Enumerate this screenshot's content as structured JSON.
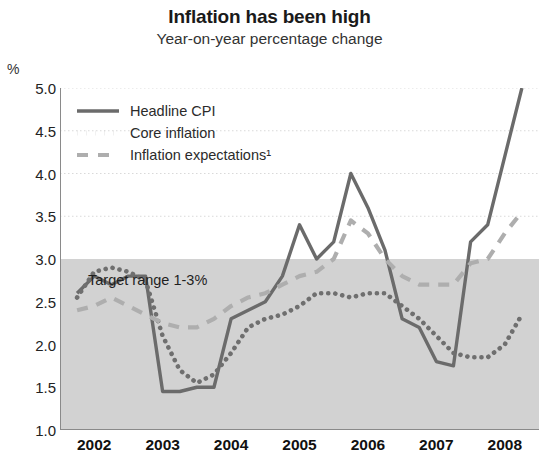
{
  "header": {
    "title": "Inflation has been high",
    "subtitle": "Year-on-year percentage change",
    "unit_label": "%"
  },
  "annotations": {
    "target_band_label": "Target range 1-3%"
  },
  "colors": {
    "headline": "#6b6b6b",
    "core": "#6f6f6f",
    "expectations": "#aeaeae",
    "band_fill": "#d2d2d2",
    "gridline": "#d9d9d9",
    "axis": "#8a8a8a",
    "text": "#1a1a1a",
    "background": "#ffffff"
  },
  "chart_data": {
    "type": "line",
    "title": "Inflation has been high",
    "subtitle": "Year-on-year percentage change",
    "xlabel": "",
    "ylabel": "%",
    "ylim": [
      1.0,
      5.0
    ],
    "xlim": [
      2001.5,
      2008.5
    ],
    "ytick_labels": [
      "1.0",
      "1.5",
      "2.0",
      "2.5",
      "3.0",
      "3.5",
      "4.0",
      "4.5",
      "5.0"
    ],
    "ytick_values": [
      1.0,
      1.5,
      2.0,
      2.5,
      3.0,
      3.5,
      4.0,
      4.5,
      5.0
    ],
    "xtick_labels": [
      "2002",
      "2003",
      "2004",
      "2005",
      "2006",
      "2007",
      "2008"
    ],
    "xtick_values": [
      2002,
      2003,
      2004,
      2005,
      2006,
      2007,
      2008
    ],
    "grid": true,
    "legend_position": "top-left",
    "shaded_band": {
      "label": "Target range 1-3%",
      "y_from": 1.0,
      "y_to": 3.0,
      "color": "#d2d2d2"
    },
    "series": [
      {
        "name": "Headline CPI",
        "style": "solid",
        "color": "#6b6b6b",
        "x": [
          2001.75,
          2002.0,
          2002.25,
          2002.5,
          2002.75,
          2003.0,
          2003.25,
          2003.5,
          2003.75,
          2004.0,
          2004.25,
          2004.5,
          2004.75,
          2005.0,
          2005.25,
          2005.5,
          2005.75,
          2006.0,
          2006.25,
          2006.5,
          2006.75,
          2007.0,
          2007.25,
          2007.5,
          2007.75,
          2008.0,
          2008.25
        ],
        "values": [
          2.6,
          2.8,
          2.7,
          2.8,
          2.8,
          1.45,
          1.45,
          1.5,
          1.5,
          2.3,
          2.4,
          2.5,
          2.8,
          3.4,
          3.0,
          3.2,
          4.0,
          3.6,
          3.1,
          2.3,
          2.2,
          1.8,
          1.75,
          3.2,
          3.4,
          4.2,
          5.0
        ]
      },
      {
        "name": "Core inflation",
        "style": "dotted",
        "color": "#6f6f6f",
        "x": [
          2001.75,
          2002.0,
          2002.25,
          2002.5,
          2002.75,
          2003.0,
          2003.25,
          2003.5,
          2003.75,
          2004.0,
          2004.25,
          2004.5,
          2004.75,
          2005.0,
          2005.25,
          2005.5,
          2005.75,
          2006.0,
          2006.25,
          2006.5,
          2006.75,
          2007.0,
          2007.25,
          2007.5,
          2007.75,
          2008.0,
          2008.25
        ],
        "values": [
          2.55,
          2.85,
          2.9,
          2.85,
          2.75,
          2.1,
          1.7,
          1.55,
          1.65,
          1.9,
          2.2,
          2.3,
          2.35,
          2.45,
          2.6,
          2.6,
          2.55,
          2.6,
          2.6,
          2.45,
          2.3,
          2.1,
          1.9,
          1.85,
          1.85,
          2.0,
          2.35
        ]
      },
      {
        "name": "Inflation expectations¹",
        "style": "dashed",
        "color": "#aeaeae",
        "x": [
          2001.75,
          2002.0,
          2002.25,
          2002.5,
          2002.75,
          2003.0,
          2003.25,
          2003.5,
          2003.75,
          2004.0,
          2004.25,
          2004.5,
          2004.75,
          2005.0,
          2005.25,
          2005.5,
          2005.75,
          2006.0,
          2006.25,
          2006.5,
          2006.75,
          2007.0,
          2007.25,
          2007.5,
          2007.75,
          2008.0,
          2008.25
        ],
        "values": [
          2.4,
          2.45,
          2.55,
          2.45,
          2.35,
          2.25,
          2.2,
          2.2,
          2.3,
          2.45,
          2.55,
          2.6,
          2.7,
          2.8,
          2.85,
          3.0,
          3.45,
          3.3,
          3.0,
          2.8,
          2.7,
          2.7,
          2.7,
          2.95,
          3.0,
          3.3,
          3.55
        ]
      }
    ]
  },
  "legend": {
    "items": [
      {
        "label": "Headline CPI",
        "style": "solid"
      },
      {
        "label": "Core inflation",
        "style": "dotted"
      },
      {
        "label": "Inflation expectations¹",
        "style": "dashed"
      }
    ]
  }
}
